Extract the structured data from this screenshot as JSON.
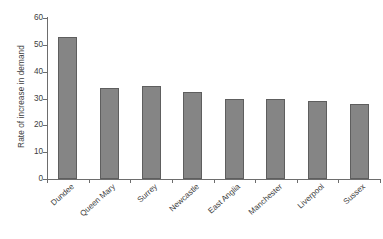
{
  "chart_data": {
    "type": "bar",
    "title": "",
    "xlabel": "",
    "ylabel": "Rate of increase in demand",
    "ylim": [
      0,
      60
    ],
    "yticks": [
      0,
      10,
      20,
      30,
      40,
      50,
      60
    ],
    "grid": false,
    "legend": null,
    "bar_color": "#858585",
    "bar_border_color": "#5e5e5e",
    "axis_color": "#6d6d6d",
    "background": "#ffffff",
    "categories": [
      "Dundee",
      "Queen Mary",
      "Surrey",
      "Newcastle",
      "East Anglia",
      "Manchester",
      "Liverpool",
      "Sussex"
    ],
    "values": [
      53,
      34,
      34.5,
      32.5,
      30,
      30,
      29,
      28
    ]
  }
}
